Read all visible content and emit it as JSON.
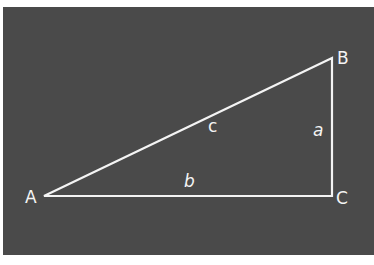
{
  "diagram": {
    "type": "right-triangle",
    "background_color": "#4a4a4a",
    "line_color": "#f4f4f4",
    "vertices": [
      {
        "label": "A",
        "x": 44,
        "y": 196
      },
      {
        "label": "B",
        "x": 332,
        "y": 58
      },
      {
        "label": "C",
        "x": 332,
        "y": 196
      }
    ],
    "sides": [
      {
        "label": "c",
        "between": "A-B"
      },
      {
        "label": "a",
        "between": "B-C"
      },
      {
        "label": "b",
        "between": "A-C"
      }
    ],
    "right_angle_at": "C"
  }
}
